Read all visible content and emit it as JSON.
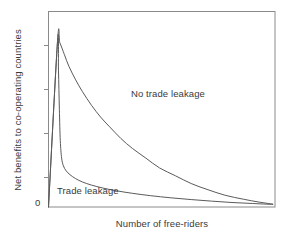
{
  "chart_data": {
    "type": "line",
    "title": "",
    "xlabel": "Number of free-riders",
    "ylabel": "Net benefits to co-operating countries",
    "grid": false,
    "legend_position": "inline-annotation",
    "xlim": [
      0,
      100
    ],
    "ylim": [
      0,
      100
    ],
    "x_tick_labels": [],
    "y_tick_labels": [
      "0"
    ],
    "y_tick_count": 5,
    "annotations": [
      {
        "text": "No trade leakage",
        "x": 37,
        "y": 56
      },
      {
        "text": "Trade leakage",
        "x": 4,
        "y": 7
      }
    ],
    "series": [
      {
        "name": "No trade leakage",
        "color": "#5a5a5a",
        "points": [
          [
            0,
            0
          ],
          [
            4,
            85
          ],
          [
            5,
            84
          ],
          [
            7,
            78
          ],
          [
            9,
            72
          ],
          [
            12,
            65
          ],
          [
            15,
            59
          ],
          [
            19,
            52
          ],
          [
            23,
            46
          ],
          [
            27,
            41
          ],
          [
            32,
            35
          ],
          [
            37,
            30
          ],
          [
            43,
            25
          ],
          [
            49,
            20
          ],
          [
            56,
            16
          ],
          [
            63,
            12
          ],
          [
            70,
            9
          ],
          [
            78,
            6
          ],
          [
            86,
            4
          ],
          [
            93,
            2.5
          ],
          [
            99,
            1.5
          ]
        ]
      },
      {
        "name": "Trade leakage",
        "color": "#5a5a5a",
        "points": [
          [
            0,
            0
          ],
          [
            4,
            85
          ],
          [
            4.4,
            70
          ],
          [
            4.8,
            50
          ],
          [
            5.2,
            34
          ],
          [
            5.8,
            25
          ],
          [
            6.6,
            21
          ],
          [
            7.8,
            18.5
          ],
          [
            9.5,
            16.5
          ],
          [
            12,
            14.5
          ],
          [
            15,
            12.8
          ],
          [
            19,
            11.2
          ],
          [
            24,
            9.7
          ],
          [
            30,
            8.3
          ],
          [
            37,
            7.0
          ],
          [
            45,
            5.8
          ],
          [
            54,
            4.7
          ],
          [
            63,
            3.8
          ],
          [
            72,
            3.0
          ],
          [
            81,
            2.3
          ],
          [
            90,
            1.8
          ],
          [
            99,
            1.3
          ]
        ]
      }
    ]
  }
}
